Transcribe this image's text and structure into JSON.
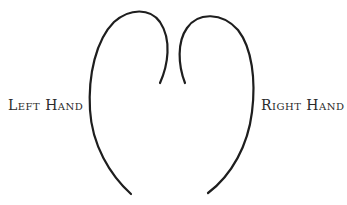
{
  "diagram": {
    "labels": {
      "left": "Left Hand",
      "right": "Right Hand"
    },
    "stroke_color": "#1e1e1e",
    "background_color": "#ffffff",
    "shapes": {
      "left_curve": "open curve, left lobe of a heart-like outline",
      "right_curve": "open curve, right lobe of a heart-like outline"
    }
  }
}
